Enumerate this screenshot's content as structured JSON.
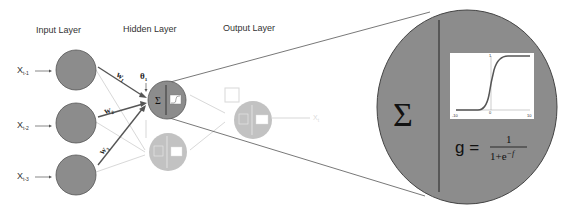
{
  "layers": {
    "input": "Input Layer",
    "hidden": "Hidden Layer",
    "output": "Output Layer"
  },
  "inputs": [
    {
      "label": "X",
      "sub": "t-1"
    },
    {
      "label": "X",
      "sub": "t-2"
    },
    {
      "label": "X",
      "sub": "t-3"
    }
  ],
  "weights": [
    {
      "label": "w",
      "sub": "1"
    },
    {
      "label": "w",
      "sub": "2"
    },
    {
      "label": "w",
      "sub": "3"
    }
  ],
  "bias": {
    "label": "θ",
    "sub": "1"
  },
  "output": {
    "label": "X",
    "sub": "t"
  },
  "neuron": {
    "sum_symbol": "Σ"
  },
  "zoom_panel": {
    "sum_symbol": "Σ",
    "plot": {
      "x_min_label": "-10",
      "x_zero_label": "0",
      "x_max_label": "10",
      "y_max_label": "1"
    },
    "formula": {
      "lhs": "g =",
      "numerator": "1",
      "denominator": "1+e",
      "exponent": "−f"
    }
  },
  "colors": {
    "node_fill": "#8c8c8c",
    "node_stroke": "#555555",
    "line": "#555555",
    "text": "#333333"
  }
}
